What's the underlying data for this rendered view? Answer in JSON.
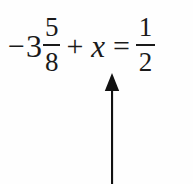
{
  "document": {
    "type": "math-equation-with-annotation",
    "background_color": "#fefefe",
    "ink_color": "#1a1a1a"
  },
  "equation": {
    "full_text": "-3 5/8 + x = 1/2",
    "left_side": {
      "mixed_number": {
        "sign": "−",
        "whole": "3",
        "fraction": {
          "numerator": "5",
          "denominator": "8"
        }
      },
      "plus_operator": "+",
      "variable": "x"
    },
    "equals_operator": "=",
    "right_side": {
      "fraction": {
        "numerator": "1",
        "denominator": "2"
      }
    }
  },
  "annotation": {
    "kind": "arrow",
    "direction": "up",
    "color": "#111111",
    "points_at": "+ x",
    "shaft_width_px": 2,
    "head_width_px": 15,
    "head_height_px": 17
  }
}
